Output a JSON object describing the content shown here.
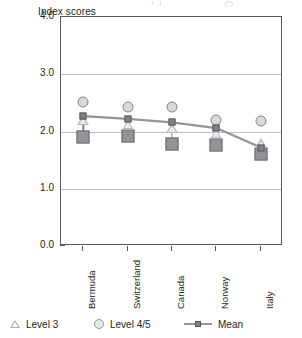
{
  "chart_data": {
    "type": "line",
    "title": "",
    "xlabel": "",
    "ylabel": "Index scores",
    "categories": [
      "Bermuda",
      "Switzerland",
      "Canada",
      "Norway",
      "Italy"
    ],
    "ylim": [
      0.0,
      4.0
    ],
    "ytick_labels": [
      "0.0",
      "1.0",
      "2.0",
      "3.0",
      "4.0"
    ],
    "ytick_values": [
      0.0,
      1.0,
      2.0,
      3.0,
      4.0
    ],
    "grid": "horizontal",
    "legend_position": "bottom",
    "series": [
      {
        "name": "Level 3",
        "marker": "triangle",
        "color": "#b5b7b9",
        "values": [
          2.2,
          2.12,
          2.06,
          1.96,
          1.8
        ]
      },
      {
        "name": "Level 4/5",
        "marker": "circle",
        "color": "#d9dadb",
        "values": [
          2.52,
          2.42,
          2.42,
          2.2,
          2.18
        ]
      },
      {
        "name": "Mean",
        "marker": "square-line",
        "color": "#808285",
        "values": [
          2.27,
          2.22,
          2.16,
          2.06,
          1.72
        ]
      },
      {
        "name": "Level 1/2",
        "marker": "large-square",
        "color": "#929497",
        "values": [
          1.91,
          1.93,
          1.78,
          1.76,
          1.6
        ]
      }
    ]
  },
  "axis": {
    "y_title": "Index scores"
  },
  "legend": {
    "items": [
      {
        "label": "Level 3",
        "marker": "triangle-outline-icon"
      },
      {
        "label": "Level 4/5",
        "marker": "circle-outline-icon"
      },
      {
        "label": "Mean",
        "marker": "line-square-icon"
      }
    ]
  },
  "colors": {
    "frame": "#58595b",
    "gridline": "#bcbec0",
    "marker_circle": "#d9dadb",
    "marker_triangle": "#b5b7b9",
    "marker_mean": "#808285",
    "marker_large_square": "#929497",
    "text": "#231f20"
  }
}
